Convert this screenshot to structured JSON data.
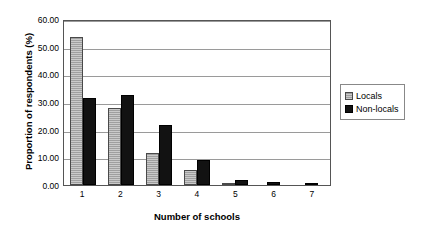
{
  "chart_data": {
    "type": "bar",
    "title": "",
    "xlabel": "Number of schools",
    "ylabel": "Proportion of respondents (%)",
    "categories": [
      "1",
      "2",
      "3",
      "4",
      "5",
      "6",
      "7"
    ],
    "series": [
      {
        "name": "Locals",
        "color": "#a9a9a9",
        "values": [
          53.4,
          27.8,
          11.4,
          5.5,
          0.9,
          0.0,
          0.0
        ]
      },
      {
        "name": "Non-locals",
        "color": "#121212",
        "values": [
          31.3,
          32.6,
          21.7,
          9.2,
          1.9,
          1.2,
          0.5
        ]
      }
    ],
    "ylim": [
      0,
      60
    ],
    "yticks": [
      "0.00",
      "10.00",
      "20.00",
      "30.00",
      "40.00",
      "50.00",
      "60.00"
    ],
    "ytick_values": [
      0,
      10,
      20,
      30,
      40,
      50,
      60
    ],
    "grid": true,
    "legend_position": "right"
  }
}
